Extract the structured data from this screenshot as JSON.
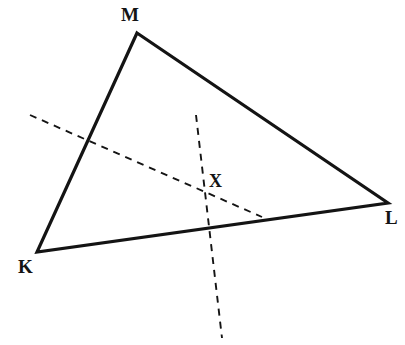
{
  "figure": {
    "width": 405,
    "height": 345,
    "background_color": "#ffffff",
    "stroke_color": "#141414",
    "solid_stroke_width": 3.2,
    "dashed_stroke_width": 1.9,
    "dash_pattern": "7,6"
  },
  "triangle": {
    "name": "KLM",
    "stroke_color": "#141414",
    "fill": "none",
    "vertices": [
      {
        "id": "M",
        "label": "M",
        "x": 137,
        "y": 33,
        "label_x": 121,
        "label_y": 5
      },
      {
        "id": "L",
        "label": "L",
        "x": 388,
        "y": 203,
        "label_x": 385,
        "label_y": 208
      },
      {
        "id": "K",
        "label": "K",
        "x": 37,
        "y": 252,
        "label_x": 18,
        "label_y": 257
      }
    ],
    "sides": [
      {
        "id": "KM",
        "from": "K",
        "to": "M",
        "style": "solid"
      },
      {
        "id": "ML",
        "from": "M",
        "to": "L",
        "style": "solid"
      },
      {
        "id": "KL",
        "from": "K",
        "to": "L",
        "style": "solid"
      }
    ],
    "path": "M 137 33 L 388 203 L 37 252 Z"
  },
  "dashed_lines": [
    {
      "id": "line-1",
      "description": "dashed line from upper-left exterior through X to side KL",
      "x1": 30,
      "y1": 115,
      "x2": 262,
      "y2": 217,
      "style": "dashed"
    },
    {
      "id": "line-2",
      "description": "near-vertical dashed line from interior top through X past side KL to below the triangle",
      "x1": 196,
      "y1": 115,
      "x2": 222,
      "y2": 338,
      "style": "dashed"
    }
  ],
  "intersection_point": {
    "id": "X",
    "label": "X",
    "x": 203,
    "y": 193,
    "label_x": 209,
    "label_y": 172
  }
}
